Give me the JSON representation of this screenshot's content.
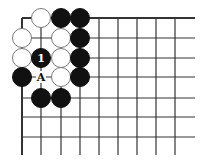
{
  "diagram": {
    "type": "go-board-corner",
    "grid": {
      "columns_x": [
        22,
        41,
        61,
        80,
        99,
        118,
        137,
        156,
        175
      ],
      "rows_y": [
        18,
        38,
        58,
        77,
        98,
        117,
        137
      ],
      "right_extent": 195,
      "bottom_extent": 155,
      "line_color": "#333333",
      "edge_top": true,
      "edge_left": true
    },
    "stones": [
      {
        "col": 1,
        "row": 0,
        "color": "white"
      },
      {
        "col": 2,
        "row": 0,
        "color": "black"
      },
      {
        "col": 3,
        "row": 0,
        "color": "black"
      },
      {
        "col": 0,
        "row": 1,
        "color": "white"
      },
      {
        "col": 2,
        "row": 1,
        "color": "white"
      },
      {
        "col": 3,
        "row": 1,
        "color": "black"
      },
      {
        "col": 0,
        "row": 2,
        "color": "white"
      },
      {
        "col": 1,
        "row": 2,
        "color": "black",
        "label": "1"
      },
      {
        "col": 2,
        "row": 2,
        "color": "white"
      },
      {
        "col": 3,
        "row": 2,
        "color": "black"
      },
      {
        "col": 0,
        "row": 3,
        "color": "black"
      },
      {
        "col": 2,
        "row": 3,
        "color": "white"
      },
      {
        "col": 3,
        "row": 3,
        "color": "black"
      },
      {
        "col": 1,
        "row": 4,
        "color": "black"
      },
      {
        "col": 2,
        "row": 4,
        "color": "black"
      }
    ],
    "point_labels": [
      {
        "col": 1,
        "row": 3,
        "text": "A"
      }
    ],
    "stone_radius": 9.5,
    "colors": {
      "black": "#111111",
      "white": "#ffffff",
      "white_outline": "#777777"
    }
  }
}
